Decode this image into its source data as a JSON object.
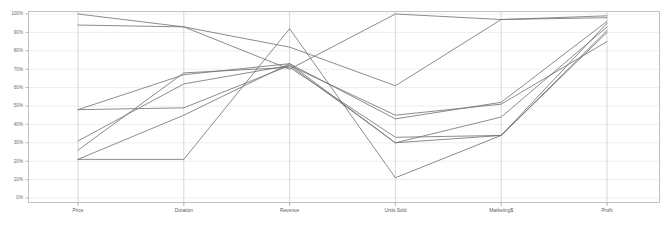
{
  "chart_data": {
    "type": "line",
    "subtype": "parallel-coordinates",
    "title": "",
    "xlabel": "",
    "ylabel": "",
    "ylim": [
      0,
      100
    ],
    "y_unit": "%",
    "grid": true,
    "legend": "none",
    "axis_color": "#b4b4b4",
    "grid_color": "#e6e6e6",
    "line_color": "#6e6e6e",
    "background": "#ffffff",
    "categories": [
      "Price",
      "Duration",
      "Revenue",
      "Units Sold",
      "Marketing$",
      "Profit"
    ],
    "ytick_labels": [
      "0%",
      "10%",
      "20%",
      "30%",
      "40%",
      "50%",
      "60%",
      "70%",
      "80%",
      "90%",
      "100%"
    ],
    "ytick_values": [
      0,
      10,
      20,
      30,
      40,
      50,
      60,
      70,
      80,
      90,
      100
    ],
    "series": [
      {
        "name": "Series 1",
        "values": [
          100,
          93,
          82,
          61,
          97,
          99
        ]
      },
      {
        "name": "Series 2",
        "values": [
          94,
          93,
          70,
          100,
          97,
          98
        ]
      },
      {
        "name": "Series 3",
        "values": [
          48,
          67,
          73,
          43,
          52,
          96
        ]
      },
      {
        "name": "Series 4",
        "values": [
          48,
          49,
          72,
          45,
          51,
          85
        ]
      },
      {
        "name": "Series 5",
        "values": [
          31,
          62,
          72,
          30,
          44,
          93
        ]
      },
      {
        "name": "Series 6",
        "values": [
          26,
          68,
          71,
          33,
          34,
          91
        ]
      },
      {
        "name": "Series 7",
        "values": [
          21,
          45,
          73,
          30,
          34,
          90
        ]
      },
      {
        "name": "Series 8",
        "values": [
          21,
          21,
          92,
          11,
          34,
          95
        ]
      }
    ]
  },
  "plot": {
    "left_px": 78,
    "right_px": 607,
    "top_px": 14,
    "bottom_px": 198,
    "frame_left_px": 28,
    "frame_right_px": 660,
    "frame_top_px": 11,
    "frame_bottom_px": 203
  }
}
